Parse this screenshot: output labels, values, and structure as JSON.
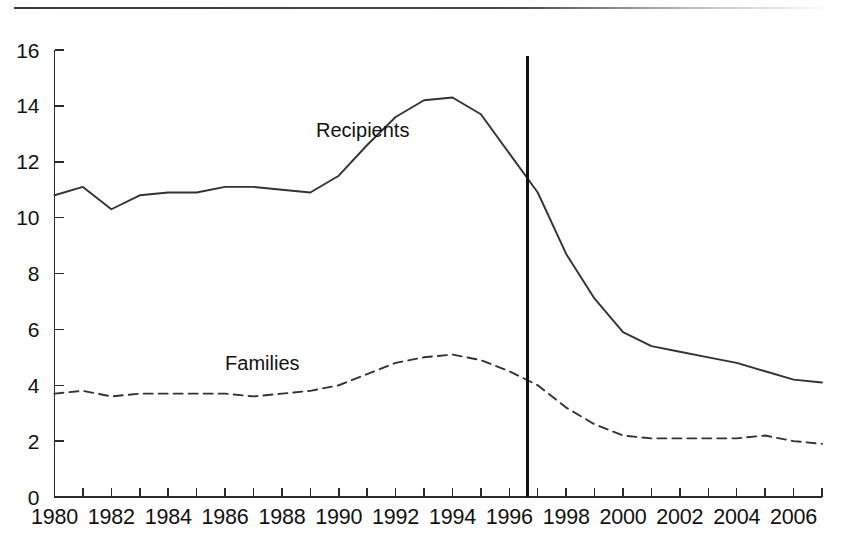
{
  "chart_data": {
    "type": "line",
    "title": "",
    "subtitle": "",
    "xlabel": "",
    "ylabel": "",
    "xlim": [
      1980,
      2007
    ],
    "ylim": [
      0,
      16
    ],
    "yticks": [
      0,
      2,
      4,
      6,
      8,
      10,
      12,
      14,
      16
    ],
    "ytick_labels": [
      "0",
      "2",
      "4",
      "6",
      "8",
      "10",
      "12",
      "14",
      "16"
    ],
    "xticks": [
      1980,
      1981,
      1982,
      1983,
      1984,
      1985,
      1986,
      1987,
      1988,
      1989,
      1990,
      1991,
      1992,
      1993,
      1994,
      1995,
      1996,
      1997,
      1998,
      1999,
      2000,
      2001,
      2002,
      2003,
      2004,
      2005,
      2006,
      2007
    ],
    "xtick_labels": [
      "1980",
      "1982",
      "1984",
      "1986",
      "1988",
      "1990",
      "1992",
      "1994",
      "1996",
      "1998",
      "2000",
      "2002",
      "2004",
      "2006"
    ],
    "xtick_label_years": [
      1980,
      1982,
      1984,
      1986,
      1988,
      1990,
      1992,
      1994,
      1996,
      1998,
      2000,
      2002,
      2004,
      2006
    ],
    "grid": false,
    "legend_position": "inline-annotation",
    "x": [
      1980,
      1981,
      1982,
      1983,
      1984,
      1985,
      1986,
      1987,
      1988,
      1989,
      1990,
      1991,
      1992,
      1993,
      1994,
      1995,
      1996,
      1997,
      1998,
      1999,
      2000,
      2001,
      2002,
      2003,
      2004,
      2005,
      2006,
      2007
    ],
    "series": [
      {
        "name": "Recipients",
        "style": "solid",
        "color": "#333333",
        "label_x": 1989.2,
        "label_y": 12.9,
        "values": [
          10.8,
          11.1,
          10.3,
          10.8,
          10.9,
          10.9,
          11.1,
          11.1,
          11.0,
          10.9,
          11.5,
          12.6,
          13.6,
          14.2,
          14.3,
          13.7,
          12.3,
          10.9,
          8.7,
          7.1,
          5.9,
          5.4,
          5.2,
          5.0,
          4.8,
          4.5,
          4.2,
          4.1
        ]
      },
      {
        "name": "Families",
        "style": "dashed",
        "color": "#333333",
        "label_x": 1986.0,
        "label_y": 4.55,
        "values": [
          3.7,
          3.8,
          3.6,
          3.7,
          3.7,
          3.7,
          3.7,
          3.6,
          3.7,
          3.8,
          4.0,
          4.4,
          4.8,
          5.0,
          5.1,
          4.9,
          4.5,
          4.0,
          3.2,
          2.6,
          2.2,
          2.1,
          2.1,
          2.1,
          2.1,
          2.2,
          2.0,
          1.9
        ]
      }
    ],
    "annotations": [
      {
        "name": "reform-marker",
        "type": "vertical-line",
        "x": 1996.65,
        "y_top": 15.8,
        "y_bottom": 0,
        "label": ""
      }
    ]
  },
  "axis": {
    "y_axis_name": "y-axis",
    "x_axis_name": "x-axis"
  }
}
